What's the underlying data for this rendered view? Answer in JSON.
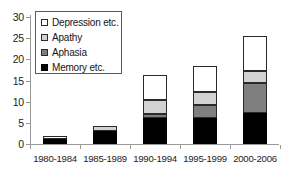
{
  "chart_data": {
    "type": "bar",
    "stacked": true,
    "title": "",
    "subtitle": "",
    "xlabel": "",
    "ylabel": "",
    "categories": [
      "1980-1984",
      "1985-1989",
      "1990-1994",
      "1995-1999",
      "2000-2006"
    ],
    "series": [
      {
        "name": "Memory etc.",
        "color": "#000000",
        "values": [
          1.1,
          3.0,
          6.2,
          6.2,
          7.4
        ]
      },
      {
        "name": "Aphasia",
        "color": "#7f7f7f",
        "values": [
          0.0,
          0.0,
          1.0,
          3.0,
          6.9
        ]
      },
      {
        "name": "Apathy",
        "color": "#d2d2d2",
        "values": [
          0.0,
          1.2,
          3.1,
          3.1,
          2.9
        ]
      },
      {
        "name": "Depression etc.",
        "color": "#ffffff",
        "values": [
          0.8,
          0.0,
          6.1,
          6.1,
          8.2
        ]
      }
    ],
    "totals": [
      1.9,
      4.2,
      16.4,
      18.4,
      25.4
    ],
    "ylim": [
      0,
      30
    ],
    "yticks": [
      "0",
      "5",
      "10",
      "15",
      "20",
      "25",
      "30"
    ],
    "ytick_values": [
      0,
      5,
      10,
      15,
      20,
      25,
      30
    ],
    "grid": false,
    "legend_position": "top-left",
    "legend_order": [
      "Depression etc.",
      "Apathy",
      "Aphasia",
      "Memory etc."
    ]
  },
  "legend": {
    "items": [
      {
        "label": "Depression etc.",
        "swatch": "white-square-icon"
      },
      {
        "label": "Apathy",
        "swatch": "light-gray-square-icon"
      },
      {
        "label": "Aphasia",
        "swatch": "dark-gray-square-icon"
      },
      {
        "label": "Memory etc.",
        "swatch": "black-square-icon"
      }
    ]
  },
  "axis": {
    "y_labels": [
      "30",
      "25",
      "20",
      "15",
      "10",
      "5",
      "0"
    ],
    "x_labels": [
      "1980-1984",
      "1985-1989",
      "1990-1994",
      "1995-1999",
      "2000-2006"
    ]
  }
}
